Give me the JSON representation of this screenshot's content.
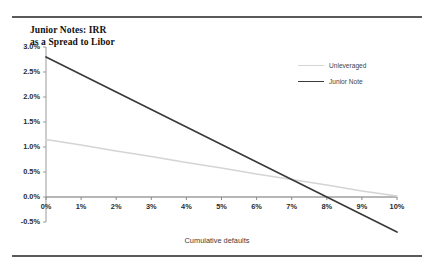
{
  "figure": {
    "title_line1": "Junior Notes: IRR",
    "title_line2": "as a Spread to Libor",
    "rule_color": "#5a5a5a"
  },
  "legend": {
    "position": "inside-top-right",
    "items": [
      {
        "label": "Unleveraged",
        "color": "#d4d4d4"
      },
      {
        "label": "Junior Note",
        "color": "#3a3a3a"
      }
    ]
  },
  "axes": {
    "x_title": "Cumulative defaults",
    "y_ticks": [
      "3.0%",
      "2.5%",
      "2.0%",
      "1.5%",
      "1.0%",
      "0.5%",
      "0.0%",
      "-0.5%"
    ],
    "x_ticks": [
      "0%",
      "1%",
      "2%",
      "3%",
      "4%",
      "5%",
      "6%",
      "7%",
      "8%",
      "9%",
      "10%"
    ]
  },
  "chart_data": {
    "type": "line",
    "title": "Junior Notes: IRR as a Spread to Libor",
    "xlabel": "Cumulative defaults",
    "ylabel": "",
    "xlim": [
      0,
      10
    ],
    "ylim": [
      -0.5,
      3.0
    ],
    "x_tick_values": [
      0,
      1,
      2,
      3,
      4,
      5,
      6,
      7,
      8,
      9,
      10
    ],
    "y_tick_values": [
      -0.5,
      0.0,
      0.5,
      1.0,
      1.5,
      2.0,
      2.5,
      3.0
    ],
    "x_unit": "percent",
    "y_unit": "percent",
    "grid": false,
    "legend": "upper right inside",
    "series": [
      {
        "name": "Unleveraged",
        "color": "#d4d4d4",
        "x": [
          0,
          1,
          2,
          3,
          4,
          5,
          6,
          7,
          8,
          9,
          10
        ],
        "values": [
          1.15,
          1.04,
          0.92,
          0.81,
          0.69,
          0.58,
          0.46,
          0.35,
          0.24,
          0.12,
          0.02
        ]
      },
      {
        "name": "Junior Note",
        "color": "#3a3a3a",
        "x": [
          0,
          1,
          2,
          3,
          4,
          5,
          6,
          7,
          8,
          9,
          10
        ],
        "values": [
          2.8,
          2.45,
          2.1,
          1.75,
          1.4,
          1.05,
          0.7,
          0.35,
          0.0,
          -0.35,
          -0.7
        ]
      }
    ],
    "annotations": []
  }
}
